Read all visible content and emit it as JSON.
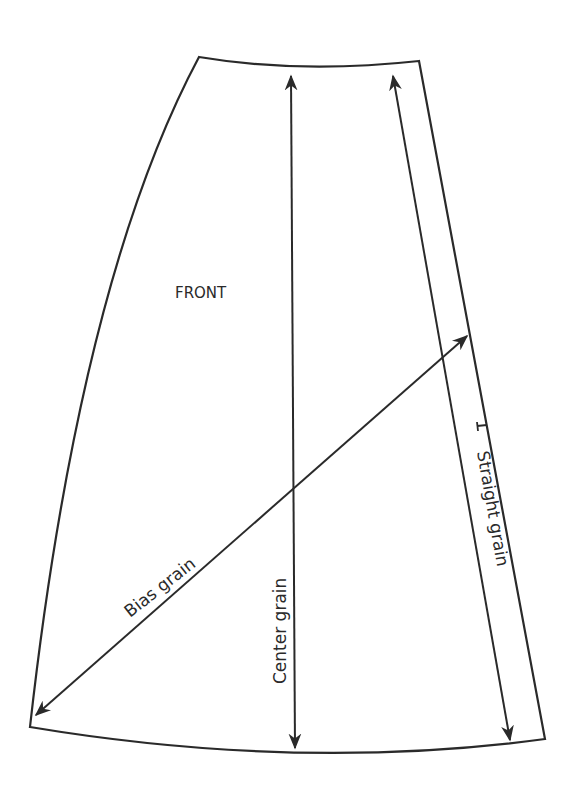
{
  "diagram": {
    "title": "FRONT",
    "piece_label": "FRONT",
    "grainlines": [
      {
        "id": "center",
        "label": "Center grain"
      },
      {
        "id": "straight",
        "label": "Straight grain"
      },
      {
        "id": "bias",
        "label": "Bias grain"
      }
    ],
    "colors": {
      "line": "#2a2a2a",
      "background": "#ffffff"
    }
  }
}
